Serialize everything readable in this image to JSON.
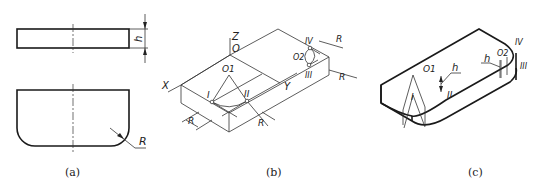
{
  "figure": {
    "panels": [
      {
        "id": "a",
        "caption": "(a)",
        "view": "orthographic top and front views of rounded plate",
        "labels": {
          "height": "h",
          "radius": "R"
        }
      },
      {
        "id": "b",
        "caption": "(b)",
        "view": "isometric construction of rounded corners",
        "labels": {
          "z_axis": "Z",
          "origin": "O",
          "x_axis": "X",
          "y_axis": "Y",
          "center1": "O1",
          "center2": "O2",
          "tangent1": "I",
          "tangent2": "II",
          "tangent3": "III",
          "tangent4": "IV",
          "radius": "R"
        }
      },
      {
        "id": "c",
        "caption": "(c)",
        "view": "finished isometric of rounded plate",
        "labels": {
          "center1": "O1",
          "center2": "O2",
          "height": "h",
          "tangent1": "I",
          "tangent2": "II",
          "tangent3": "III",
          "tangent4": "IV"
        }
      }
    ]
  }
}
